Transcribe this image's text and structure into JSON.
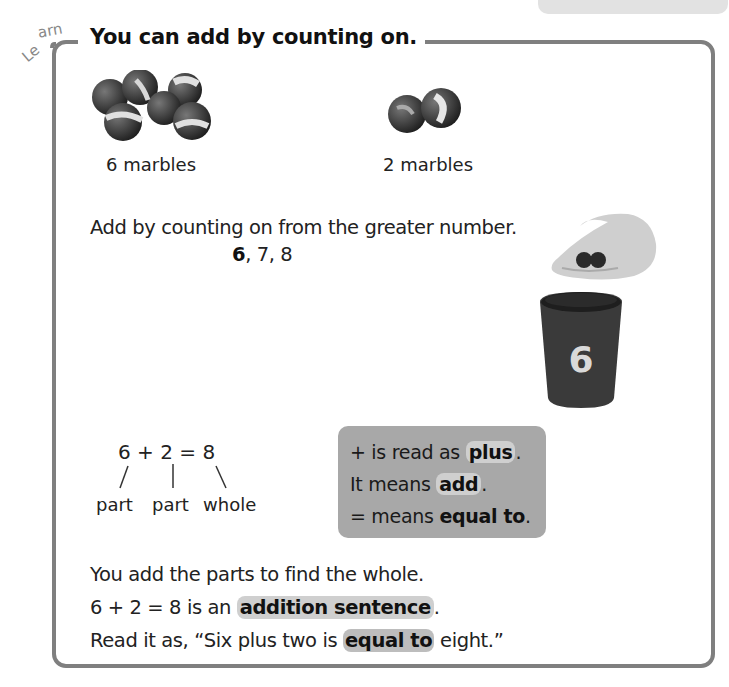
{
  "header": {
    "top_tab_text": "more than",
    "section_tag": "Learn",
    "title": "You can add by counting on."
  },
  "marbles": {
    "group1_label": "6 marbles",
    "group1_count": 6,
    "group2_label": "2 marbles",
    "group2_count": 2
  },
  "counting": {
    "instruction": "Add by counting on from the greater number.",
    "start": "6",
    "rest": ", 7, 8"
  },
  "cup": {
    "number": "6"
  },
  "equation": {
    "text": "6 + 2 = 8",
    "labels": [
      "part",
      "part",
      "whole"
    ]
  },
  "vocab_box": {
    "line1_pre": "+ is read as ",
    "line1_term": "plus",
    "line1_post": ".",
    "line2_pre": "It means ",
    "line2_term": "add",
    "line2_post": ".",
    "line3_pre": "= means ",
    "line3_term": "equal to",
    "line3_post": "."
  },
  "summary": {
    "line1": "You add the parts to find the whole.",
    "line2_pre": "6 + 2 = 8 is an ",
    "line2_term": "addition sentence",
    "line2_post": ".",
    "line3_pre": "Read it as, “Six plus two is ",
    "line3_term": "equal to",
    "line3_post": " eight.”"
  },
  "colors": {
    "frame": "#7f7f7f",
    "highlight": "#cfcfcf",
    "vocab_bg": "#a8a8a8"
  }
}
